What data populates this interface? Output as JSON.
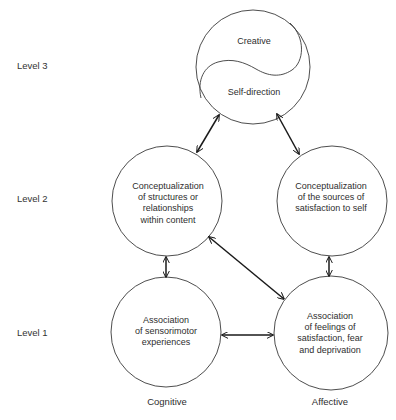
{
  "levels": [
    {
      "label": "Level 3",
      "y": 66
    },
    {
      "label": "Level 2",
      "y": 199
    },
    {
      "label": "Level 1",
      "y": 333
    }
  ],
  "columns": [
    {
      "label": "Cognitive",
      "x": 167
    },
    {
      "label": "Affective",
      "x": 329
    }
  ],
  "nodes": {
    "top": {
      "upper_text": "Creative",
      "lower_text": "Self-direction",
      "cx": 253,
      "cy": 67,
      "r": 57
    },
    "level2_cognitive": {
      "text": "Conceptualization\nof structures or\nrelationships\nwithin content",
      "cx": 167,
      "cy": 201,
      "r": 55
    },
    "level2_affective": {
      "text": "Conceptualization\nof the sources of\nsatisfaction to self",
      "cx": 332,
      "cy": 201,
      "r": 55
    },
    "level1_cognitive": {
      "text": "Association\nof sensorimotor\nexperiences",
      "cx": 166,
      "cy": 332,
      "r": 55
    },
    "level1_affective": {
      "text": "Association\nof feelings of\nsatisfaction, fear\nand deprivation",
      "cx": 331,
      "cy": 333,
      "r": 57
    }
  },
  "arrows": [
    {
      "from": "level2_cognitive",
      "to": "top",
      "type": "bidirectional"
    },
    {
      "from": "level2_affective",
      "to": "top",
      "type": "bidirectional"
    },
    {
      "from": "level1_cognitive",
      "to": "level2_cognitive",
      "type": "bidirectional"
    },
    {
      "from": "level1_affective",
      "to": "level2_affective",
      "type": "bidirectional"
    },
    {
      "from": "level2_cognitive",
      "to": "level1_affective",
      "type": "bidirectional"
    },
    {
      "from": "level1_cognitive",
      "to": "level1_affective",
      "type": "bidirectional"
    }
  ],
  "colors": {
    "stroke": "#3a3a3a",
    "arrow": "#1a1a1a",
    "text": "#2e2e2e"
  }
}
